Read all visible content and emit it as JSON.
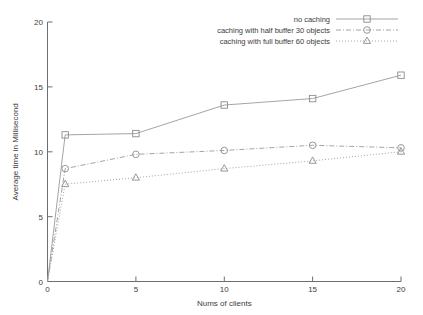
{
  "chart_data": {
    "type": "line",
    "title": "",
    "xlabel": "Nums of clients",
    "ylabel": "Average time in Millisecond",
    "xlim": [
      0,
      20
    ],
    "ylim": [
      0,
      20
    ],
    "xticks": [
      0,
      5,
      10,
      15,
      20
    ],
    "yticks": [
      0,
      5,
      10,
      15,
      20
    ],
    "xticklabels": [
      "0",
      "5",
      "10",
      "15",
      "20"
    ],
    "yticklabels": [
      "0",
      "5",
      "10",
      "15",
      "20"
    ],
    "grid": false,
    "legend_position": "top-right",
    "x": [
      0,
      1,
      5,
      10,
      15,
      20
    ],
    "series": [
      {
        "name": "no caching",
        "marker": "square",
        "linestyle": "solid",
        "color": "#9a9a9a",
        "values": [
          0,
          11.3,
          11.4,
          13.6,
          14.1,
          15.9
        ]
      },
      {
        "name": "caching with half buffer 30 objects",
        "marker": "circle",
        "linestyle": "dashdot",
        "color": "#9a9a9a",
        "values": [
          0,
          8.7,
          9.8,
          10.1,
          10.5,
          10.3
        ]
      },
      {
        "name": "caching with full buffer 60 objects",
        "marker": "triangle",
        "linestyle": "dotted",
        "color": "#9a9a9a",
        "values": [
          0,
          7.5,
          8.0,
          8.7,
          9.3,
          10.0
        ]
      }
    ]
  },
  "axes": {
    "x_title": "Nums of clients",
    "y_title": "Average time in Millisecond",
    "x_tick_0": "0",
    "x_tick_1": "5",
    "x_tick_2": "10",
    "x_tick_3": "15",
    "x_tick_4": "20",
    "y_tick_0": "0",
    "y_tick_1": "5",
    "y_tick_2": "10",
    "y_tick_3": "15",
    "y_tick_4": "20"
  },
  "legend": {
    "entry_0": "no caching",
    "entry_1": "caching with half buffer 30 objects",
    "entry_2": "caching with full buffer 60 objects"
  }
}
